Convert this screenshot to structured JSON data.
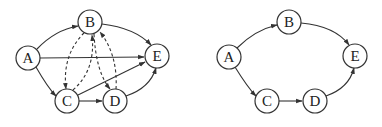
{
  "graphs": [
    {
      "id": "left",
      "nodes": [
        {
          "label": "A",
          "x": 28,
          "y": 58
        },
        {
          "label": "B",
          "x": 90,
          "y": 22
        },
        {
          "label": "C",
          "x": 67,
          "y": 101
        },
        {
          "label": "D",
          "x": 115,
          "y": 101
        },
        {
          "label": "E",
          "x": 157,
          "y": 56
        }
      ],
      "edges": [
        {
          "from": "A",
          "to": "B",
          "style": "solid"
        },
        {
          "from": "A",
          "to": "E",
          "style": "solid"
        },
        {
          "from": "A",
          "to": "C",
          "style": "solid"
        },
        {
          "from": "B",
          "to": "E",
          "style": "solid"
        },
        {
          "from": "C",
          "to": "E",
          "style": "solid"
        },
        {
          "from": "C",
          "to": "D",
          "style": "solid"
        },
        {
          "from": "D",
          "to": "E",
          "style": "solid"
        },
        {
          "from": "B",
          "to": "C",
          "style": "dashed"
        },
        {
          "from": "C",
          "to": "B",
          "style": "dashed"
        },
        {
          "from": "B",
          "to": "D",
          "style": "dashed"
        },
        {
          "from": "D",
          "to": "B",
          "style": "dashed"
        }
      ]
    },
    {
      "id": "right",
      "nodes": [
        {
          "label": "A",
          "x": 229,
          "y": 57
        },
        {
          "label": "B",
          "x": 289,
          "y": 22
        },
        {
          "label": "C",
          "x": 267,
          "y": 101
        },
        {
          "label": "D",
          "x": 315,
          "y": 101
        },
        {
          "label": "E",
          "x": 355,
          "y": 56
        }
      ],
      "edges": [
        {
          "from": "A",
          "to": "B",
          "style": "solid"
        },
        {
          "from": "B",
          "to": "E",
          "style": "solid"
        },
        {
          "from": "A",
          "to": "C",
          "style": "solid"
        },
        {
          "from": "C",
          "to": "D",
          "style": "solid"
        },
        {
          "from": "D",
          "to": "E",
          "style": "solid"
        }
      ]
    }
  ],
  "labels": {
    "left": {
      "A": "A",
      "B": "B",
      "C": "C",
      "D": "D",
      "E": "E"
    },
    "right": {
      "A": "A",
      "B": "B",
      "C": "C",
      "D": "D",
      "E": "E"
    }
  }
}
